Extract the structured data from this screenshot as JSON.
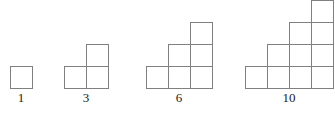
{
  "diagram": {
    "background_color": "#ffffff",
    "stroke_color": "#808080",
    "stroke_width": 1.3,
    "fill_color": "#ffffff",
    "label_color": "#1a1a1a",
    "cell_size": 22,
    "baseline_y": 88,
    "label_y": 91,
    "figures": [
      {
        "name": "figure-1",
        "label": "1",
        "term_index": 1,
        "square_count": 1,
        "rows": [
          1
        ],
        "left_x": 10,
        "label_center_x": 21,
        "width_cells": 1,
        "height_cells": 1
      },
      {
        "name": "figure-2",
        "label": "3",
        "term_index": 2,
        "square_count": 3,
        "rows": [
          2,
          1
        ],
        "left_x": 64,
        "label_center_x": 86,
        "width_cells": 2,
        "height_cells": 2
      },
      {
        "name": "figure-3",
        "label": "6",
        "term_index": 3,
        "square_count": 6,
        "rows": [
          3,
          2,
          1
        ],
        "left_x": 146,
        "label_center_x": 179,
        "width_cells": 3,
        "height_cells": 3
      },
      {
        "name": "figure-4",
        "label": "10",
        "term_index": 4,
        "square_count": 10,
        "rows": [
          4,
          3,
          2,
          1
        ],
        "left_x": 245,
        "label_center_x": 289,
        "width_cells": 4,
        "height_cells": 4
      }
    ]
  },
  "chart_data": {
    "type": "bar",
    "categories": [
      "1",
      "2",
      "3",
      "4"
    ],
    "values": [
      1,
      3,
      6,
      10
    ],
    "xlabel": "",
    "ylabel": "",
    "data_labels": [
      "1",
      "3",
      "6",
      "10"
    ]
  }
}
